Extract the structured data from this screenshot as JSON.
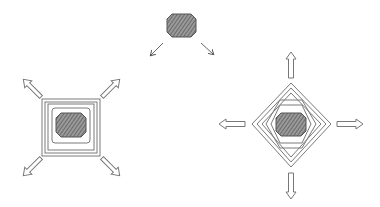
{
  "diagram": {
    "colors": {
      "background": "#ffffff",
      "line": "#7a7a7a",
      "hatch_fill": "#8c8c8c",
      "hatch_line": "#4a4a4a"
    },
    "nodes": [
      {
        "id": "source-blob",
        "shape": "octagon-hatched",
        "position": "top-center"
      },
      {
        "id": "square-variant",
        "shape": "nested-squares",
        "rings": 4,
        "center_shape": "octagon-hatched",
        "arrows": [
          "up-left",
          "up-right",
          "down-left",
          "down-right"
        ],
        "position": "left"
      },
      {
        "id": "diamond-variant",
        "shape": "nested-diamonds",
        "rings": 5,
        "center_shape": "octagon-hatched",
        "arrows": [
          "up",
          "right",
          "down",
          "left"
        ],
        "position": "right"
      }
    ],
    "edges": [
      {
        "from": "source-blob",
        "to": "square-variant",
        "style": "thin-arrow"
      },
      {
        "from": "source-blob",
        "to": "diamond-variant",
        "style": "thin-arrow"
      }
    ]
  }
}
